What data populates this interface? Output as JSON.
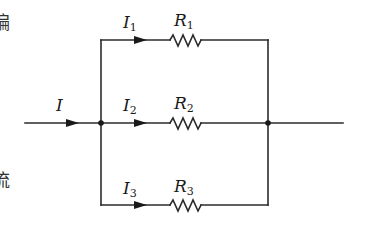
{
  "diagram": {
    "type": "parallel-circuit",
    "colors": {
      "wire": "#2b2b2b",
      "text": "#1a1a1a",
      "background": "#ffffff"
    },
    "main_current": {
      "symbol": "I",
      "sub": ""
    },
    "branches": [
      {
        "current": "I",
        "current_sub": "1",
        "resistor": "R",
        "resistor_sub": "1"
      },
      {
        "current": "I",
        "current_sub": "2",
        "resistor": "R",
        "resistor_sub": "2"
      },
      {
        "current": "I",
        "current_sub": "3",
        "resistor": "R",
        "resistor_sub": "3"
      }
    ],
    "edge_glyphs": [
      "偏",
      "·",
      "流"
    ]
  }
}
